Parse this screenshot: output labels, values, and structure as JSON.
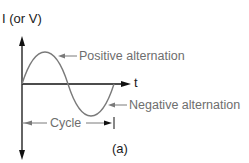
{
  "diagram": {
    "y_axis_label": "I (or V)",
    "x_axis_label": "t",
    "annotations": {
      "positive": "Positive alternation",
      "negative": "Negative alternation",
      "cycle": "Cycle"
    },
    "caption": "(a)",
    "colors": {
      "axis": "#111111",
      "wave": "#7a7a7a",
      "annotation_text": "#6e6e6e",
      "background": "#ffffff"
    }
  }
}
